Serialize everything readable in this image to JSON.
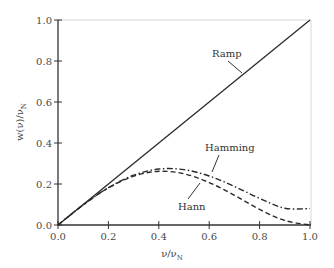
{
  "chart_data": {
    "type": "line",
    "title": "",
    "xlabel": "ν/ν_N",
    "ylabel": "w(ν)/ν_N",
    "xlim": [
      0.0,
      1.0
    ],
    "ylim": [
      0.0,
      1.0
    ],
    "grid": false,
    "legend": "none (inline annotations)",
    "x_ticks": [
      "0.0",
      "0.2",
      "0.4",
      "0.6",
      "0.8",
      "1.0"
    ],
    "y_ticks": [
      "0.0",
      "0.2",
      "0.4",
      "0.6",
      "0.8",
      "1.0"
    ],
    "x": [
      0.0,
      0.1,
      0.2,
      0.3,
      0.4,
      0.5,
      0.6,
      0.7,
      0.8,
      0.9,
      1.0
    ],
    "series": [
      {
        "name": "Ramp",
        "style": "solid",
        "values": [
          0.0,
          0.1,
          0.2,
          0.3,
          0.4,
          0.5,
          0.6,
          0.7,
          0.8,
          0.9,
          1.0
        ]
      },
      {
        "name": "Hamming",
        "style": "dash-dot",
        "values": [
          0.0,
          0.098,
          0.182,
          0.243,
          0.273,
          0.27,
          0.239,
          0.188,
          0.13,
          0.082,
          0.08
        ]
      },
      {
        "name": "Hann",
        "style": "dashed",
        "values": [
          0.0,
          0.098,
          0.181,
          0.238,
          0.262,
          0.25,
          0.207,
          0.145,
          0.076,
          0.022,
          0.0
        ]
      }
    ],
    "annotations": [
      {
        "text": "Ramp",
        "target": "Ramp"
      },
      {
        "text": "Hamming",
        "target": "Hamming"
      },
      {
        "text": "Hann",
        "target": "Hann"
      }
    ]
  },
  "labels": {
    "xlabel_main": "ν/ν",
    "xlabel_sub": "N",
    "ylabel_main": "w(ν)/ν",
    "ylabel_sub": "N",
    "ramp": "Ramp",
    "hamming": "Hamming",
    "hann": "Hann"
  }
}
